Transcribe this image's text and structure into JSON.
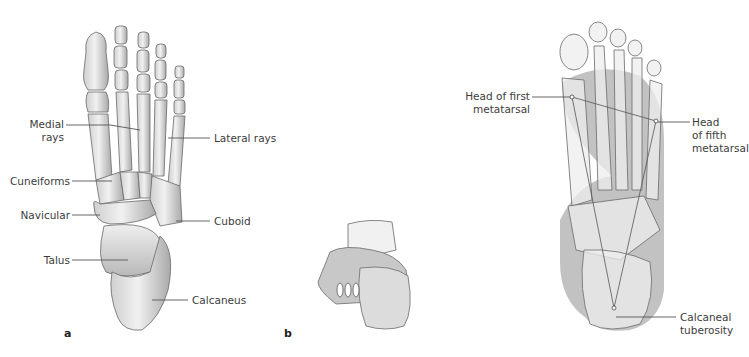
{
  "figure": {
    "panels": [
      {
        "id": "a",
        "letter": "a",
        "view": "dorsal view of right foot skeleton",
        "labels": {
          "medial_rays": "Medial\nrays",
          "medial_rays_l1": "Medial",
          "medial_rays_l2": "rays",
          "lateral_rays": "Lateral rays",
          "cuneiforms": "Cuneiforms",
          "navicular": "Navicular",
          "cuboid": "Cuboid",
          "talus": "Talus",
          "calcaneus": "Calcaneus"
        }
      },
      {
        "id": "b",
        "letter": "b",
        "view": "posterior view of foot skeleton"
      },
      {
        "id": "c",
        "letter": "",
        "view": "plantar view with weight-bearing triangle",
        "labels": {
          "head_first_l1": "Head of first",
          "head_first_l2": "metatarsal",
          "head_fifth_l1": "Head",
          "head_fifth_l2": "of fifth",
          "head_fifth_l3": "metatarsal",
          "calcaneal_l1": "Calcaneal",
          "calcaneal_l2": "tuberosity"
        }
      }
    ],
    "colors": {
      "bone_fill": "#e9e9e9",
      "bone_shade": "#bdbdbd",
      "bone_outline": "#6a6a6a",
      "contact_area": "#9a9a9a",
      "leader_line": "#555555",
      "text": "#3c3c3c"
    }
  }
}
